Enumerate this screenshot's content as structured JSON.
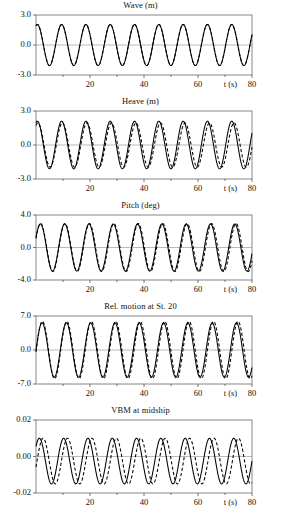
{
  "figure": {
    "kind": "multi-panel-timeseries",
    "panel_count": 5
  },
  "chart_data": [
    {
      "type": "line",
      "title": "Wave (m)",
      "xlabel": "t (s)",
      "ylabel": "",
      "xlim": [
        0,
        80
      ],
      "ylim": [
        -3.0,
        3.0
      ],
      "xticks": [
        20,
        40,
        60,
        80
      ],
      "xtick_labels": [
        "20",
        "40",
        "60",
        "80"
      ],
      "yticks": [
        3.0,
        0.0,
        -3.0
      ],
      "ytick_labels": [
        "3.0",
        "0.0",
        "-3.0"
      ],
      "grid": false,
      "legend": "none",
      "series": [
        {
          "name": "solid",
          "style": "solid",
          "amplitude": 2.05,
          "period": 9.0,
          "phase_deg": 70,
          "phase_drift_deg_per_s": 0
        },
        {
          "name": "dashed",
          "style": "dashed",
          "amplitude": 2.05,
          "period": 9.0,
          "phase_deg": 70,
          "phase_drift_deg_per_s": 0
        }
      ]
    },
    {
      "type": "line",
      "title": "Heave (m)",
      "xlabel": "t (s)",
      "ylabel": "",
      "xlim": [
        0,
        80
      ],
      "ylim": [
        -3.0,
        3.0
      ],
      "xticks": [
        20,
        40,
        60,
        80
      ],
      "xtick_labels": [
        "20",
        "40",
        "60",
        "80"
      ],
      "yticks": [
        3.0,
        0.0,
        -3.0
      ],
      "ytick_labels": [
        "3.0",
        "0.0",
        "-3.0"
      ],
      "grid": false,
      "legend": "none",
      "series": [
        {
          "name": "solid",
          "style": "solid",
          "amplitude": 2.1,
          "period": 9.0,
          "phase_deg": 70,
          "phase_drift_deg_per_s": 0
        },
        {
          "name": "dashed",
          "style": "dashed",
          "amplitude": 1.95,
          "period": 9.0,
          "phase_deg": 62,
          "phase_drift_deg_per_s": -0.35
        }
      ]
    },
    {
      "type": "line",
      "title": "Pitch (deg)",
      "xlabel": "t (s)",
      "ylabel": "",
      "xlim": [
        0,
        80
      ],
      "ylim": [
        -4.0,
        4.0
      ],
      "xticks": [
        20,
        40,
        60,
        80
      ],
      "xtick_labels": [
        "20",
        "40",
        "60",
        "80"
      ],
      "yticks": [
        4.0,
        0.0,
        -4.0
      ],
      "ytick_labels": [
        "4.0",
        "0.0",
        "-4.0"
      ],
      "grid": false,
      "legend": "none",
      "series": [
        {
          "name": "solid",
          "style": "solid",
          "amplitude": 2.9,
          "period": 9.0,
          "phase_deg": 25,
          "phase_drift_deg_per_s": 0
        },
        {
          "name": "dashed",
          "style": "dashed",
          "amplitude": 2.95,
          "period": 9.0,
          "phase_deg": 22,
          "phase_drift_deg_per_s": -0.2
        }
      ]
    },
    {
      "type": "line",
      "title": "Rel. motion at St. 20",
      "xlabel": "t (s)",
      "ylabel": "",
      "xlim": [
        0,
        80
      ],
      "ylim": [
        -7.0,
        7.0
      ],
      "xticks": [
        20,
        40,
        60,
        80
      ],
      "xtick_labels": [
        "20",
        "40",
        "60",
        "80"
      ],
      "yticks": [
        7.0,
        0.0,
        -7.0
      ],
      "ytick_labels": [
        "7.0",
        "0.0",
        "-7.0"
      ],
      "grid": false,
      "legend": "none",
      "series": [
        {
          "name": "solid",
          "style": "solid",
          "amplitude": 5.6,
          "period": 9.0,
          "phase_deg": 0,
          "phase_drift_deg_per_s": 0
        },
        {
          "name": "dashed",
          "style": "dashed",
          "amplitude": 5.9,
          "period": 9.0,
          "phase_deg": -4,
          "phase_drift_deg_per_s": -0.25
        }
      ]
    },
    {
      "type": "line",
      "title": "VBM at midship",
      "xlabel": "t (s)",
      "ylabel": "",
      "xlim": [
        0,
        80
      ],
      "ylim": [
        -0.02,
        0.02
      ],
      "xticks": [
        20,
        40,
        60,
        80
      ],
      "xtick_labels": [
        "20",
        "40",
        "60",
        "80"
      ],
      "yticks": [
        0.02,
        0.0,
        -0.02
      ],
      "ytick_labels": [
        "0.02",
        "0.00",
        "-0.02"
      ],
      "grid": false,
      "legend": "none",
      "series": [
        {
          "name": "solid",
          "style": "solid",
          "amplitude": 0.0125,
          "period": 9.0,
          "phase_deg": 40,
          "phase_drift_deg_per_s": 0,
          "offset": -0.0025
        },
        {
          "name": "dashed",
          "style": "dashed",
          "amplitude": 0.0125,
          "period": 9.0,
          "phase_deg": -15,
          "phase_drift_deg_per_s": -0.2,
          "offset": -0.0025
        }
      ]
    }
  ]
}
